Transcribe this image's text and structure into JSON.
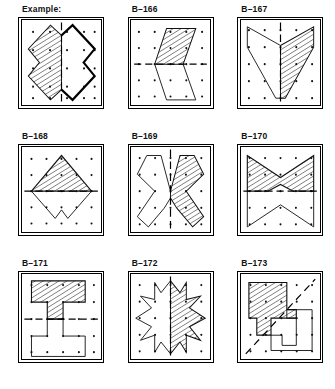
{
  "page": {
    "grid": {
      "columns": 3,
      "rows": 3
    },
    "dot_grid": {
      "columns": 5,
      "rows": 5,
      "dot_color": "#111111"
    },
    "ink_color": "#111111",
    "paper_color": "#ffffff"
  },
  "panels": [
    {
      "label": "Example:",
      "id": "example",
      "mirror_axis": "vertical",
      "shaded_half": "left",
      "completed": true,
      "shape_name": "bowtie-cross",
      "description": "Hatched X/bowtie half at left mirrored by a bold-outlined half at right across a vertical dashed line."
    },
    {
      "label": "B–166",
      "id": "b-166",
      "mirror_axis": "horizontal",
      "shaded_half": "top",
      "completed": true,
      "shape_name": "parallelogram",
      "description": "Hatched slanted parallelogram above a horizontal dashed line, mirrored below."
    },
    {
      "label": "B–167",
      "id": "b-167",
      "mirror_axis": "vertical",
      "shaded_half": "right",
      "completed": true,
      "shape_name": "chevron-vee",
      "description": "Hatched vee/chevron wedge right of a vertical dashed line, mirrored left."
    },
    {
      "label": "B–168",
      "id": "b-168",
      "mirror_axis": "horizontal",
      "shaded_half": "top",
      "completed": true,
      "shape_name": "diamond",
      "description": "Hatched upper half of a diamond above a horizontal dashed line, mirrored below with a notch."
    },
    {
      "label": "B–169",
      "id": "b-169",
      "mirror_axis": "vertical",
      "shaded_half": "right",
      "completed": true,
      "shape_name": "butterfly-x",
      "description": "Hatched butterfly/X half at right of a vertical dashed line, mirrored at left."
    },
    {
      "label": "B–170",
      "id": "b-170",
      "mirror_axis": "horizontal",
      "shaded_half": "top",
      "completed": true,
      "shape_name": "four-point-star",
      "description": "Hatched upper half of a four-pointed star above a horizontal dashed line, mirrored below."
    },
    {
      "label": "B–171",
      "id": "b-171",
      "mirror_axis": "horizontal",
      "shaded_half": "top",
      "completed": true,
      "shape_name": "tee-block",
      "description": "Hatched T-shaped block above a horizontal dashed line, mirrored below as a U-shape."
    },
    {
      "label": "B–172",
      "id": "b-172",
      "mirror_axis": "vertical",
      "shaded_half": "right",
      "completed": true,
      "shape_name": "eight-point-star",
      "description": "Hatched right half of an eight-pointed star beside a vertical dashed line, mirrored left."
    },
    {
      "label": "B–173",
      "id": "b-173",
      "mirror_axis": "diagonal",
      "shaded_half": "upper-left",
      "completed": true,
      "shape_name": "stepped-polygon",
      "description": "Hatched stepped polygon at upper left of a diagonal dashed line, mirrored at lower right."
    }
  ]
}
